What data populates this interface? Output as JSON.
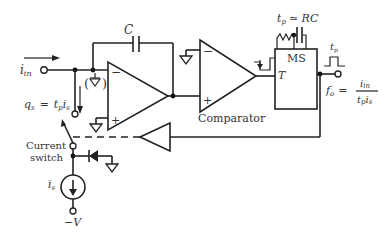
{
  "diagram": {
    "labels": {
      "input": "i",
      "input_sub": "in",
      "capacitor": "C",
      "charge_eq_left": "q",
      "charge_eq_left_sub": "s",
      "charge_eq_eq": "=",
      "charge_eq_right": "t",
      "charge_eq_right_sub1": "p",
      "charge_eq_right2": "i",
      "charge_eq_right_sub2": "s",
      "comparator": "Comparator",
      "monostable": "MS",
      "trigger": "T",
      "pulse_width_eq": "t",
      "pulse_width_sub": "p",
      "pulse_width_approx": "≃ RC",
      "pulse_label": "t",
      "pulse_label_sub": "p",
      "fo": "f",
      "fo_sub": "o",
      "fo_eq": "=",
      "fo_num": "i",
      "fo_num_sub": "in",
      "fo_den": "t",
      "fo_den_sub1": "p",
      "fo_den2": "i",
      "fo_den_sub2": "s",
      "current_switch_line1": "Current",
      "current_switch_line2": "switch",
      "current_source": "i",
      "current_source_sub": "s",
      "supply": "−V"
    },
    "components": [
      "integrator-opamp",
      "capacitor-C",
      "comparator",
      "monostable-MS",
      "buffer",
      "current-switch",
      "diode",
      "current-source-is"
    ]
  }
}
